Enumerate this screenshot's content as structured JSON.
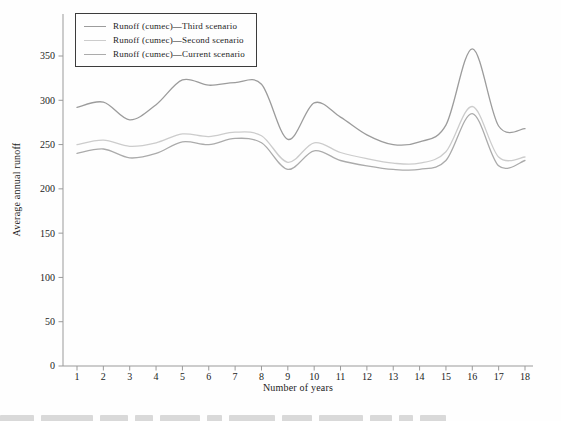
{
  "figure": {
    "y_axis_label": "Average annual runoff",
    "x_axis_label": "Number of years"
  },
  "colors": {
    "axis": "#9a9a9a",
    "tick_text": "#1c1c1c",
    "background": "#fefefe"
  },
  "legend": {
    "position": "top-left",
    "items": [
      {
        "label": "Runoff (cumec)—Third scenario",
        "color": "#9c9c9c"
      },
      {
        "label": "Runoff (cumec)—Second scenario",
        "color": "#cccccc"
      },
      {
        "label": "Runoff (cumec)—Current scenario",
        "color": "#ababab"
      }
    ]
  },
  "chart_data": {
    "type": "line",
    "title": "",
    "xlabel": "Number of years",
    "ylabel": "Average annual runoff",
    "x": [
      1,
      2,
      3,
      4,
      5,
      6,
      7,
      8,
      9,
      10,
      11,
      12,
      13,
      14,
      15,
      16,
      17,
      18
    ],
    "x_tick_labels": [
      "1",
      "2",
      "3",
      "4",
      "5",
      "6",
      "7",
      "8",
      "9",
      "10",
      "11",
      "12",
      "13",
      "14",
      "15",
      "16",
      "17",
      "18"
    ],
    "y_ticks": [
      0,
      50,
      100,
      150,
      200,
      250,
      300,
      350
    ],
    "ylim": [
      0,
      395
    ],
    "xlim": [
      0.5,
      18.3
    ],
    "grid": false,
    "legend_position": "top-left",
    "line_style": "smooth",
    "series": [
      {
        "name": "Runoff (cumec)—Third scenario",
        "color": "#9c9c9c",
        "values": [
          292,
          298,
          278,
          295,
          323,
          317,
          320,
          318,
          256,
          297,
          281,
          261,
          250,
          253,
          272,
          358,
          271,
          268
        ]
      },
      {
        "name": "Runoff (cumec)—Second scenario",
        "color": "#cccccc",
        "values": [
          250,
          255,
          248,
          252,
          262,
          259,
          264,
          260,
          230,
          252,
          241,
          234,
          229,
          229,
          242,
          293,
          236,
          236
        ]
      },
      {
        "name": "Runoff (cumec)—Current scenario",
        "color": "#ababab",
        "values": [
          240,
          245,
          235,
          240,
          253,
          250,
          257,
          252,
          222,
          243,
          232,
          226,
          222,
          222,
          232,
          285,
          226,
          232
        ]
      }
    ]
  }
}
